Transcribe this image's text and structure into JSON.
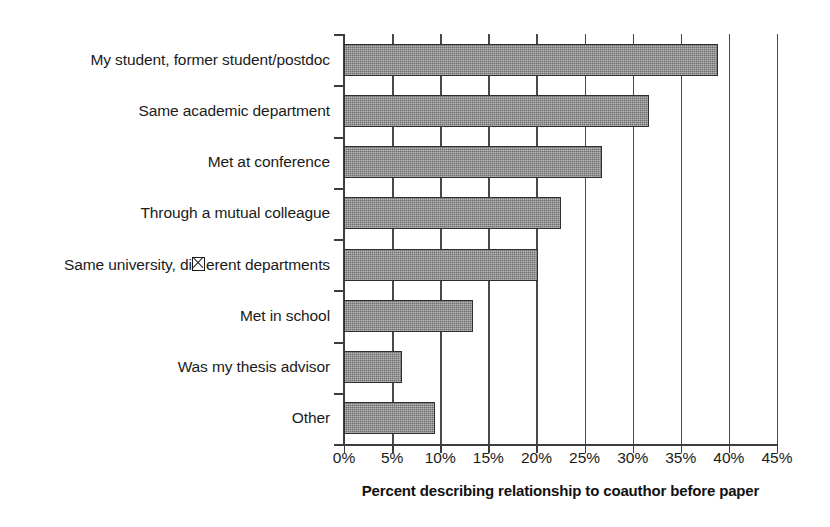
{
  "chart_data": {
    "type": "bar",
    "orientation": "horizontal",
    "title": "",
    "xlabel": "Percent describing relationship to coauthor before paper",
    "ylabel": "",
    "categories": [
      "My student, former student/postdoc",
      "Same academic department",
      "Met at conference",
      "Through a mutual colleague",
      "Same university, di⊠erent departments",
      "Met in school",
      "Was my thesis advisor",
      "Other"
    ],
    "values": [
      38.9,
      31.7,
      26.8,
      22.5,
      20.2,
      13.4,
      6.0,
      9.5
    ],
    "xlim": [
      0,
      45
    ],
    "xticks": [
      0,
      5,
      10,
      15,
      20,
      25,
      30,
      35,
      40,
      45
    ],
    "xtick_labels": [
      "0%",
      "5%",
      "10%",
      "15%",
      "20%",
      "25%",
      "30%",
      "35%",
      "40%",
      "45%"
    ],
    "grid": "vertical",
    "legend": "none",
    "bar_color": "#6e6e6e",
    "bar_border_color": "#2f2f2f",
    "axis_color": "#3d3d3d",
    "text_color": "#1b1b1b"
  },
  "notes": {
    "glyph_issue_category_index": 4,
    "glyph_issue_prefix": "Same university, di",
    "glyph_issue_suffix": "erent departments"
  }
}
